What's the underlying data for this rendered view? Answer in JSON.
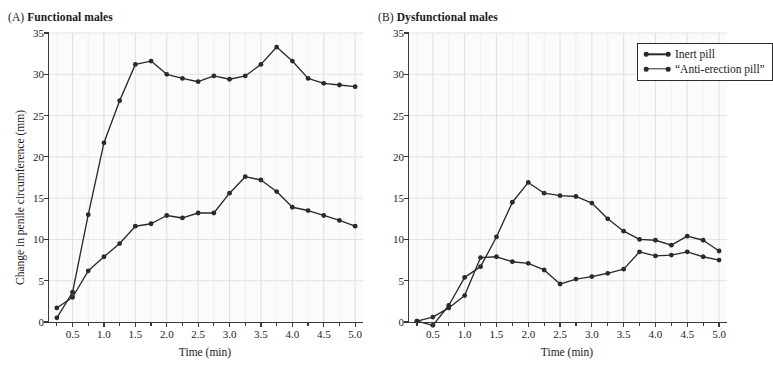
{
  "panels": [
    {
      "tag": "(A)",
      "title": "Functional males",
      "ylabel": "Change in penile circumference (mm)",
      "xlabel": "Time (min)"
    },
    {
      "tag": "(B)",
      "title": "Dysfunctional males",
      "ylabel": "",
      "xlabel": "Time (min)"
    }
  ],
  "legend": {
    "position": "top-right",
    "items": [
      {
        "label": "Inert pill"
      },
      {
        "label": "“Anti-erection pill”"
      }
    ]
  },
  "axis": {
    "y_ticks": [
      "0",
      "5",
      "10",
      "15",
      "20",
      "25",
      "30",
      "35"
    ],
    "x_ticks": [
      "0.5",
      "1.0",
      "1.5",
      "2.0",
      "2.5",
      "3.0",
      "3.5",
      "4.0",
      "4.5",
      "5.0"
    ],
    "ylim": [
      0,
      35
    ],
    "xlim": [
      0.125,
      5.125
    ],
    "grid": true,
    "line_color": "#2a2a2a",
    "grid_color": "#e2e2e2",
    "plot_bg": "#fbfbfb"
  },
  "chart_data": [
    {
      "type": "line",
      "title": "Functional males",
      "xlabel": "Time (min)",
      "ylabel": "Change in penile circumference (mm)",
      "xlim": [
        0.125,
        5.125
      ],
      "ylim": [
        0,
        35
      ],
      "grid": true,
      "legend": "top-right (shown in panel B)",
      "x": [
        0.25,
        0.5,
        0.75,
        1.0,
        1.25,
        1.5,
        1.75,
        2.0,
        2.25,
        2.5,
        2.75,
        3.0,
        3.25,
        3.5,
        3.75,
        4.0,
        4.25,
        4.5,
        4.75,
        5.0
      ],
      "series": [
        {
          "name": "Inert pill",
          "values": [
            0.5,
            3.6,
            13.0,
            21.7,
            26.8,
            31.2,
            31.6,
            30.0,
            29.5,
            29.1,
            29.8,
            29.4,
            29.8,
            31.2,
            33.3,
            31.6,
            29.5,
            28.9,
            28.7,
            28.5
          ]
        },
        {
          "name": "“Anti-erection pill”",
          "values": [
            1.7,
            3.0,
            6.2,
            7.9,
            9.5,
            11.6,
            11.9,
            12.9,
            12.6,
            13.2,
            13.2,
            15.6,
            17.6,
            17.2,
            15.8,
            13.9,
            13.5,
            12.9,
            12.3,
            11.6
          ]
        }
      ],
      "note": "Inert pill rises steeply to ~31.5 mm by 1.5-2.0 min, plateaus near 29-30 mm, peaks 33.3 mm at 3.75 min, declines to 28.5 mm. Anti-erection pill rises gradually to ~13 mm plateau, peaks 17.6 mm at 3.0 min, settles near 12.5 mm."
    },
    {
      "type": "line",
      "title": "Dysfunctional males",
      "xlabel": "Time (min)",
      "ylabel": "",
      "xlim": [
        0.125,
        5.125
      ],
      "ylim": [
        0,
        35
      ],
      "grid": true,
      "legend": "top-right",
      "x": [
        0.25,
        0.5,
        0.75,
        1.0,
        1.25,
        1.5,
        1.75,
        2.0,
        2.25,
        2.5,
        2.75,
        3.0,
        3.25,
        3.5,
        3.75,
        4.0,
        4.25,
        4.5,
        4.75,
        5.0
      ],
      "series": [
        {
          "name": "Inert pill",
          "values": [
            0.1,
            -0.4,
            2.0,
            5.4,
            6.7,
            10.3,
            14.5,
            16.9,
            15.6,
            15.3,
            15.2,
            14.4,
            12.5,
            11.0,
            10.0,
            9.9,
            9.3,
            10.4,
            9.9,
            8.6
          ]
        },
        {
          "name": "“Anti-erection pill”",
          "values": [
            0.1,
            0.6,
            1.7,
            3.2,
            7.8,
            7.9,
            7.3,
            7.1,
            6.3,
            4.6,
            5.2,
            5.5,
            5.9,
            6.4,
            8.5,
            8.0,
            8.1,
            8.5,
            7.9,
            7.5
          ]
        }
      ],
      "note": "Inert pill peaks at 16.9 mm near 2.0 min then declines to ~9 mm. Anti-erection pill rises to ~7.9 mm by 1.5 min, dips to 4.6 mm at 2.5 min, recovers to ~8 mm."
    }
  ]
}
